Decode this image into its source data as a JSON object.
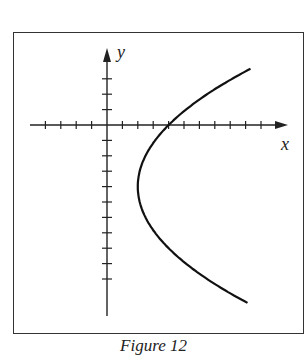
{
  "chart_data": {
    "type": "line",
    "title": "",
    "xlabel": "x",
    "ylabel": "y",
    "grid": false,
    "legend": null,
    "equation": "x = (1/8)(y + 4)^2 + 2",
    "x_ticks": {
      "min": -4,
      "max": 10,
      "step": 1,
      "labels": []
    },
    "y_ticks": {
      "min": -10,
      "max": 3,
      "step": 1,
      "labels": []
    },
    "xlim": [
      -5,
      11.5
    ],
    "ylim": [
      -11.5,
      4.5
    ],
    "series": [
      {
        "name": "parabola",
        "points": [
          {
            "x": 9.0,
            "y": 3.6
          },
          {
            "x": 6.0,
            "y": 1.66
          },
          {
            "x": 4.0,
            "y": 0
          },
          {
            "x": 3.0,
            "y": -1.17
          },
          {
            "x": 2.5,
            "y": -2.0
          },
          {
            "x": 2.0,
            "y": -4.0
          },
          {
            "x": 2.5,
            "y": -6.0
          },
          {
            "x": 3.0,
            "y": -6.83
          },
          {
            "x": 4.0,
            "y": -8.0
          },
          {
            "x": 6.0,
            "y": -9.66
          },
          {
            "x": 8.9,
            "y": -11.6
          }
        ]
      }
    ]
  },
  "caption": "Figure 12"
}
